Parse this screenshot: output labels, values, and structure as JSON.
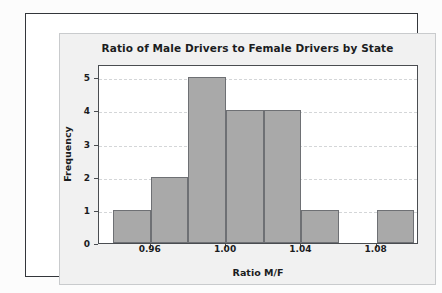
{
  "chart_data": {
    "type": "bar",
    "title": "Ratio of Male Drivers to Female Drivers by State",
    "xlabel": "Ratio M/F",
    "ylabel": "Frequency",
    "categories": [
      "0.94-0.96",
      "0.96-0.98",
      "0.98-1.00",
      "1.00-1.02",
      "1.02-1.04",
      "1.04-1.06",
      "1.06-1.08",
      "1.08-1.10"
    ],
    "bin_edges": [
      0.94,
      0.96,
      0.98,
      1.0,
      1.02,
      1.04,
      1.06,
      1.08,
      1.1
    ],
    "bin_width": 0.02,
    "values": [
      1,
      2,
      5,
      4,
      4,
      1,
      0,
      1
    ],
    "bin_centers": [
      0.95,
      0.97,
      0.99,
      1.01,
      1.03,
      1.05,
      1.07,
      1.09
    ],
    "ylim": [
      0,
      5.4
    ],
    "xlim": [
      0.9325,
      1.1025
    ],
    "ytick_labels": [
      "0",
      "1",
      "2",
      "3",
      "4",
      "5"
    ],
    "ytick_values": [
      0,
      1,
      2,
      3,
      4,
      5
    ],
    "xtick_labels": [
      "0.96",
      "1.00",
      "1.04",
      "1.08"
    ],
    "xtick_values": [
      0.96,
      1.0,
      1.04,
      1.08
    ],
    "grid": "horizontal-dashed",
    "legend": "none",
    "bar_color": "#a9a9a9",
    "bar_edge_color": "#6e7074",
    "grid_color": "#d4d6d8",
    "axis_color": "#4a4d51",
    "text_color": "#1b1c1e",
    "plot_background": "#ffffff",
    "figure_background": "#f1f1f1"
  }
}
